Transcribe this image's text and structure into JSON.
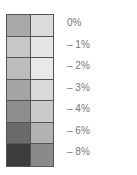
{
  "chart_data": {
    "type": "heatmap",
    "title": "",
    "legend_position": "right",
    "rows": [
      {
        "label": "0%",
        "left": "#a9a9a9",
        "right": "#dcdcdc"
      },
      {
        "label": "– 1%",
        "left": "#c7c7c7",
        "right": "#e6e6e6"
      },
      {
        "label": "– 2%",
        "left": "#bdbdbd",
        "right": "#e9e9e9"
      },
      {
        "label": "– 3%",
        "left": "#a4a4a4",
        "right": "#d9d9d9"
      },
      {
        "label": "– 4%",
        "left": "#8d8d8d",
        "right": "#cacaca"
      },
      {
        "label": "– 6%",
        "left": "#6a6a6a",
        "right": "#b2b2b2"
      },
      {
        "label": "– 8%",
        "left": "#3c3c3c",
        "right": "#8a8a8a"
      }
    ],
    "values": [
      0,
      -1,
      -2,
      -3,
      -4,
      -6,
      -8
    ]
  }
}
